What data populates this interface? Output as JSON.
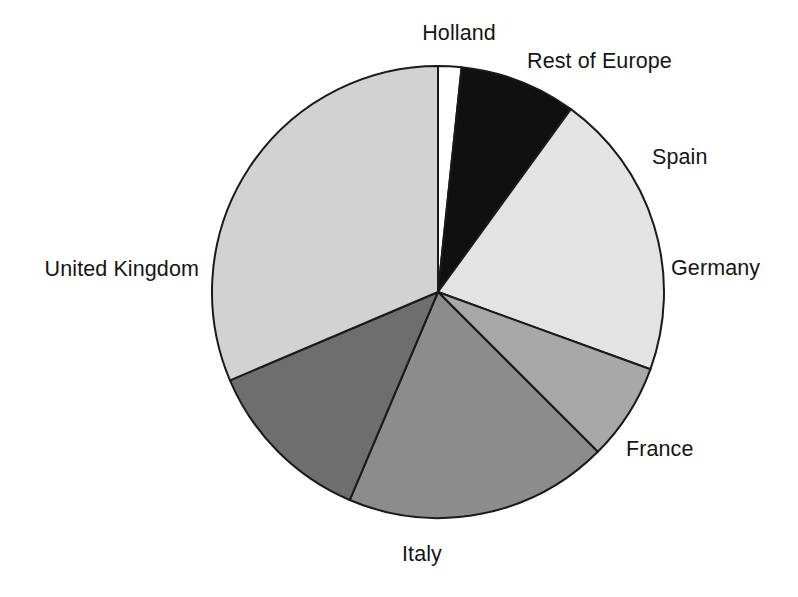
{
  "chart_data": {
    "type": "pie",
    "title": "",
    "xlabel": "",
    "ylabel": "",
    "legend_position": "none",
    "grid": false,
    "start_angle_deg": 0,
    "direction": "clockwise",
    "labels_outside": true,
    "categories": [
      "Holland",
      "Rest of Europe",
      "Spain",
      "Germany",
      "France",
      "Italy",
      "United Kingdom"
    ],
    "values": [
      1.7,
      8.3,
      20.6,
      6.9,
      18.9,
      12.2,
      31.4
    ],
    "units": "percent",
    "slices": [
      {
        "label": "Holland",
        "value": 1.7,
        "start_deg": 0,
        "end_deg": 6,
        "color": "#ffffff",
        "label_x": 459,
        "label_y": 22,
        "anchor": "mid"
      },
      {
        "label": "Rest of Europe",
        "value": 8.3,
        "start_deg": 6,
        "end_deg": 36,
        "color": "#101010",
        "label_x": 527,
        "label_y": 50,
        "anchor": "start"
      },
      {
        "label": "Spain",
        "value": 20.6,
        "start_deg": 36,
        "end_deg": 110,
        "color": "#e3e3e3",
        "label_x": 652,
        "label_y": 146,
        "anchor": "start"
      },
      {
        "label": "Germany",
        "value": 6.9,
        "start_deg": 110,
        "end_deg": 135,
        "color": "#a8a8a8",
        "label_x": 671,
        "label_y": 257,
        "anchor": "start"
      },
      {
        "label": "France",
        "value": 18.9,
        "start_deg": 135,
        "end_deg": 203,
        "color": "#8c8c8c",
        "label_x": 626,
        "label_y": 438,
        "anchor": "start"
      },
      {
        "label": "Italy",
        "value": 12.2,
        "start_deg": 203,
        "end_deg": 247,
        "color": "#6e6e6e",
        "label_x": 422,
        "label_y": 543,
        "anchor": "mid"
      },
      {
        "label": "United Kingdom",
        "value": 31.4,
        "start_deg": 247,
        "end_deg": 360,
        "color": "#d2d2d2",
        "label_x": 199,
        "label_y": 258,
        "anchor": "end"
      }
    ],
    "geometry": {
      "center_x": 438,
      "center_y": 292,
      "radius": 226,
      "stroke_color": "#1a1a1a",
      "stroke_width": 2
    },
    "background_color": "#ffffff"
  }
}
